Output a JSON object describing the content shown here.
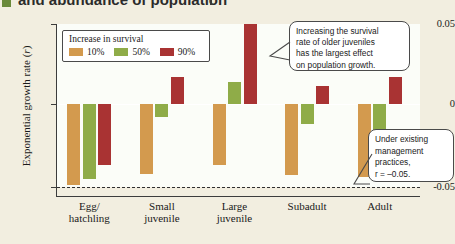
{
  "figure": {
    "title_fragment": "and abundance of population",
    "axis": {
      "ylabel_text": "Exponential growth rate (",
      "ylabel_italic": "r",
      "ylabel_close": ")",
      "yticks": [
        "0.05",
        "0",
        "-0.05"
      ]
    },
    "legend": {
      "title": "Increase in survival",
      "items": [
        {
          "label": "10%",
          "color": "#d39a4e"
        },
        {
          "label": "50%",
          "color": "#8fac48"
        },
        {
          "label": "90%",
          "color": "#a93333"
        }
      ]
    },
    "callouts": [
      {
        "name": "older-juveniles-note",
        "lines": [
          "Increasing the survival",
          "rate of older juveniles",
          "has the largest effect",
          "on population growth."
        ]
      },
      {
        "name": "baseline-note",
        "lines": [
          "Under existing",
          "management",
          "practices,",
          "r = –0.05."
        ]
      }
    ]
  },
  "chart_data": {
    "type": "bar",
    "title": "",
    "xlabel": "",
    "ylabel": "Exponential growth rate (r)",
    "ylim": [
      -0.05,
      0.05
    ],
    "grid": false,
    "legend_position": "top-left inside",
    "categories": [
      "Egg/\nhatchling",
      "Small\njuvenile",
      "Large\njuvenile",
      "Subadult",
      "Adult"
    ],
    "category_labels": [
      [
        "Egg/",
        "hatchling"
      ],
      [
        "Small",
        "juvenile"
      ],
      [
        "Large",
        "juvenile"
      ],
      [
        "Subadult",
        ""
      ],
      [
        "Adult",
        ""
      ]
    ],
    "series": [
      {
        "name": "10%",
        "color": "#d39a4e",
        "values": [
          -0.049,
          -0.042,
          -0.037,
          -0.043,
          -0.044
        ]
      },
      {
        "name": "50%",
        "color": "#8fac48",
        "values": [
          -0.045,
          -0.008,
          0.014,
          -0.012,
          -0.018
        ]
      },
      {
        "name": "90%",
        "color": "#a93333",
        "values": [
          -0.037,
          0.017,
          0.05,
          0.011,
          0.017
        ]
      }
    ],
    "reference_line": {
      "value": -0.05,
      "style": "dashed",
      "label": "r = -0.05"
    },
    "zero_line": 0
  }
}
